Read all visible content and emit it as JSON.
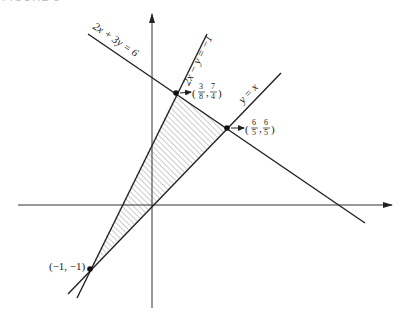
{
  "figure": {
    "caption": "FIGURE 3"
  },
  "axes": {
    "x_axis": "x-axis",
    "y_axis": "y-axis"
  },
  "lines": [
    {
      "id": "line1",
      "equation": "2x + 3y = 6"
    },
    {
      "id": "line2",
      "equation": "2x − y = −1"
    },
    {
      "id": "line3",
      "equation": "y = x"
    }
  ],
  "points": [
    {
      "label": "(3/8, 7/4)",
      "x_num": "3",
      "x_den": "8",
      "y_num": "7",
      "y_den": "4"
    },
    {
      "label": "(6/5, 6/5)",
      "x_num": "6",
      "x_den": "5",
      "y_num": "6",
      "y_den": "5"
    },
    {
      "label": "(−1, −1)"
    }
  ],
  "region": {
    "description": "shaded triangular region bounded by the three lines",
    "fill": "hatched"
  },
  "colors": {
    "line": "#222222",
    "hatch": "#999999"
  }
}
